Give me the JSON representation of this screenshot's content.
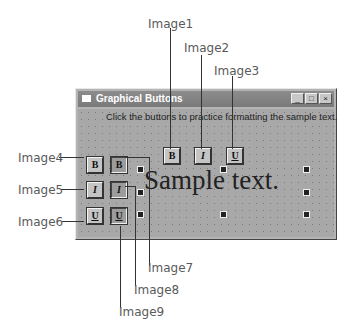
{
  "window": {
    "title": "Graphical Buttons",
    "instruction": "Click the buttons to practice formatting the sample text.",
    "controls": {
      "minimize": "_",
      "maximize": "□",
      "close": "×"
    },
    "sample_text": "Sample text."
  },
  "buttons": {
    "image1": "B",
    "image2": "I",
    "image3": "U",
    "image4": "B",
    "image5": "I",
    "image6": "U",
    "image7": "B",
    "image8": "I",
    "image9": "U"
  },
  "callouts": {
    "image1": "Image1",
    "image2": "Image2",
    "image3": "Image3",
    "image4": "Image4",
    "image5": "Image5",
    "image6": "Image6",
    "image7": "Image7",
    "image8": "Image8",
    "image9": "Image9"
  }
}
